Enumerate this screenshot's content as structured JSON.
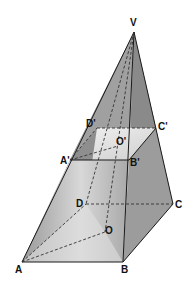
{
  "diagram": {
    "type": "frustum-pyramid",
    "colors": {
      "face_dark": "#8c8c8c",
      "face_mid": "#a6a6a6",
      "face_light": "#cfcfcf",
      "inner_light": "#e9e9e9",
      "edge": "#1a1a1a"
    },
    "labels": {
      "V": "V",
      "A": "A",
      "B": "B",
      "C": "C",
      "D": "D",
      "O": "O",
      "A_prime": "A'",
      "B_prime": "B'",
      "C_prime": "C'",
      "D_prime": "D'",
      "O_prime": "O'"
    },
    "points": {
      "V": [
        134,
        32
      ],
      "A": [
        22,
        262
      ],
      "B": [
        123,
        262
      ],
      "C": [
        173,
        204
      ],
      "D": [
        86,
        204
      ],
      "O": [
        105,
        232
      ],
      "A_prime": [
        70,
        160
      ],
      "B_prime": [
        129,
        160
      ],
      "C_prime": [
        156,
        128
      ],
      "D_prime": [
        97,
        128
      ],
      "O_prime": [
        118,
        146
      ]
    }
  }
}
